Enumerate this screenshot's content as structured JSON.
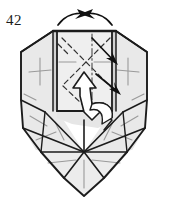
{
  "figure": {
    "step_number": "42",
    "type": "origami-folding-diagram",
    "title": "",
    "colors": {
      "paper_fill": "#e9e9e9",
      "paper_fill_light": "#efefef",
      "paper_fill_shadow": "#dcdcdc",
      "outline": "#1c1c1c",
      "crease_valley": "#8c8c8c",
      "crease_mountain": "#2a2a2a",
      "arrow_solid": "#111111",
      "arrow_hollow_fill": "#ffffff",
      "background": "#ffffff"
    },
    "annotations": {
      "top_left_arrow": "arrow-pointing-right-inward",
      "top_right_arrow": "arrow-pointing-left-inward",
      "diagonal_arrow": "arrow-pointing-down-right",
      "hollow_arrow": "white-push-arrow-pointing-up",
      "center_fold_line": "dash-dot-vertical-axis",
      "x_creases": "crossed-dashed-fold-lines",
      "left_panel_mark": "plus-crease-mark",
      "right_panel_mark": "plus-crease-mark"
    },
    "geometry": {
      "outline_points": "84,27 117,27 145,42 147,100 145,128 127,152 104,178 84,196 64,178 41,152 23,128 21,100 23,42 51,27",
      "center_panel": "57,30 112,30 112,110 57,110",
      "bottom_apex": "84,196"
    }
  }
}
